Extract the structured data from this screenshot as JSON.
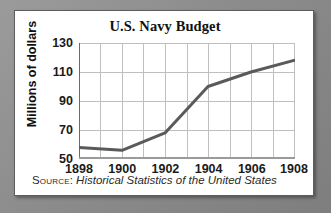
{
  "card": {
    "background_color": "#ffffff",
    "border_color": "#5d5d5d"
  },
  "page": {
    "background_color": "#8a8a8a"
  },
  "source": {
    "label": "Source:",
    "text": "Historical Statistics of the United States"
  },
  "chart_data": {
    "type": "line",
    "title": "U.S. Navy Budget",
    "xlabel": "",
    "ylabel": "Millions of dollars",
    "x": [
      1898,
      1900,
      1902,
      1904,
      1906,
      1908
    ],
    "values": [
      58,
      56,
      68,
      100,
      110,
      118
    ],
    "series": [
      {
        "name": "U.S. Navy Budget",
        "values": [
          58,
          56,
          68,
          100,
          110,
          118
        ],
        "color": "#5a5a5a"
      }
    ],
    "x_tick_labels": [
      "1898",
      "1900",
      "1902",
      "1904",
      "1906",
      "1908"
    ],
    "y_tick_labels": [
      "130",
      "110",
      "90",
      "70",
      "50"
    ],
    "y_ticks": [
      130,
      110,
      90,
      70,
      50
    ],
    "xlim": [
      1898,
      1908
    ],
    "ylim": [
      50,
      130
    ],
    "grid": true,
    "grid_x_step": 1,
    "grid_y_step": 20,
    "grid_color": "#bfbfbf",
    "axis_color": "#6b6b6b",
    "legend": "none",
    "line_color": "#5a5a5a",
    "line_width": 3,
    "markers": false
  }
}
